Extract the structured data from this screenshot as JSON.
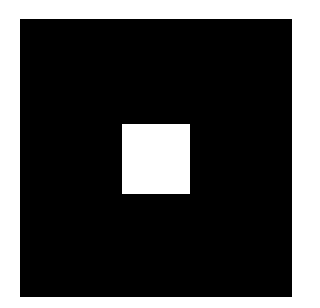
{
  "figure": {
    "background_color": "#ffffff",
    "outer_square": {
      "color": "#000000"
    },
    "inner_square": {
      "color": "#ffffff"
    }
  }
}
